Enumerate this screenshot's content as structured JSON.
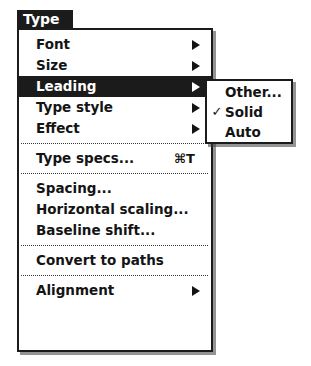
{
  "menu": {
    "title": "Type",
    "groups": [
      {
        "items": [
          {
            "label": "Font",
            "submenu": true,
            "shortcut": "",
            "selected": false
          },
          {
            "label": "Size",
            "submenu": true,
            "shortcut": "",
            "selected": false
          },
          {
            "label": "Leading",
            "submenu": true,
            "shortcut": "",
            "selected": true
          },
          {
            "label": "Type style",
            "submenu": true,
            "shortcut": "",
            "selected": false
          },
          {
            "label": "Effect",
            "submenu": true,
            "shortcut": "",
            "selected": false
          }
        ]
      },
      {
        "items": [
          {
            "label": "Type specs...",
            "submenu": false,
            "shortcut": "⌘T",
            "selected": false
          }
        ]
      },
      {
        "items": [
          {
            "label": "Spacing...",
            "submenu": false,
            "shortcut": "",
            "selected": false
          },
          {
            "label": "Horizontal scaling...",
            "submenu": false,
            "shortcut": "",
            "selected": false
          },
          {
            "label": "Baseline shift...",
            "submenu": false,
            "shortcut": "",
            "selected": false
          }
        ]
      },
      {
        "items": [
          {
            "label": "Convert to paths",
            "submenu": false,
            "shortcut": "",
            "selected": false
          }
        ]
      },
      {
        "items": [
          {
            "label": "Alignment",
            "submenu": true,
            "shortcut": "",
            "selected": false
          }
        ]
      }
    ]
  },
  "submenu": {
    "parent": "Leading",
    "items": [
      {
        "label": "Other...",
        "checked": false,
        "check_glyph": "✓"
      },
      {
        "label": "Solid",
        "checked": true,
        "check_glyph": "✓"
      },
      {
        "label": "Auto",
        "checked": false,
        "check_glyph": "✓"
      }
    ]
  },
  "colors": {
    "ink": "#1b1b1b",
    "paper": "#ffffff",
    "highlight_bg": "#1b1b1b",
    "highlight_fg": "#ffffff",
    "shadow": "#3c3c3c"
  }
}
